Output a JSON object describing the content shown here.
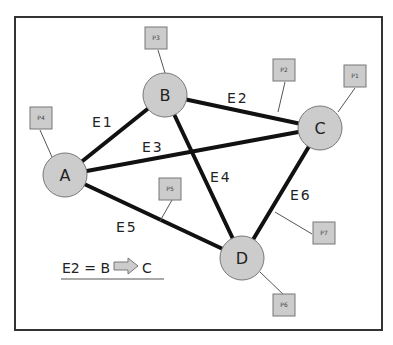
{
  "nodes": [
    {
      "id": "A",
      "label": "A",
      "x": 65,
      "y": 175
    },
    {
      "id": "B",
      "label": "B",
      "x": 165,
      "y": 95
    },
    {
      "id": "C",
      "label": "C",
      "x": 320,
      "y": 128
    },
    {
      "id": "D",
      "label": "D",
      "x": 242,
      "y": 258
    }
  ],
  "edges": [
    {
      "id": "E1",
      "label": "E1",
      "from": "A",
      "to": "B"
    },
    {
      "id": "E2",
      "label": "E2",
      "from": "B",
      "to": "C"
    },
    {
      "id": "E3",
      "label": "E3",
      "from": "A",
      "to": "C"
    },
    {
      "id": "E4",
      "label": "E4",
      "from": "B",
      "to": "D"
    },
    {
      "id": "E5",
      "label": "E5",
      "from": "A",
      "to": "D"
    },
    {
      "id": "E6",
      "label": "E6",
      "from": "C",
      "to": "D"
    }
  ],
  "ports": [
    {
      "id": "P1",
      "label": "P1"
    },
    {
      "id": "P2",
      "label": "P2"
    },
    {
      "id": "P3",
      "label": "P3"
    },
    {
      "id": "P4",
      "label": "P4"
    },
    {
      "id": "P5",
      "label": "P5"
    },
    {
      "id": "P6",
      "label": "P6"
    },
    {
      "id": "P7",
      "label": "P7"
    }
  ],
  "legend": {
    "lhs": "E2 = B",
    "rhs": "C"
  }
}
